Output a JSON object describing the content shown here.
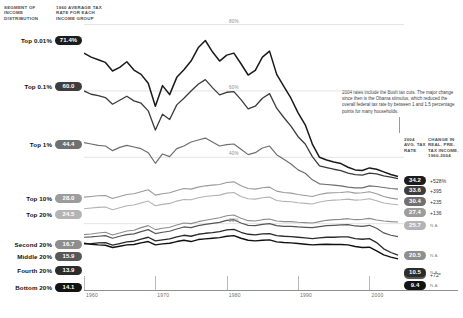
{
  "headers": {
    "segment": "SEGMENT OF INCOME DISTRIBUTION",
    "rate_1960": "1960 AVERAGE TAX RATE FOR EACH INCOME GROUP",
    "rate_2004": "2004 AVG. TAX RATE",
    "change": "CHANGE IN REAL, PRE-TAX INCOME, 1960-2004"
  },
  "annotation": "2004 rates include the Bush tax cuts. The major change since then is the Obama stimulus, which reduced the overall federal tax rate by between 1 and 1.5 percentage points for many households.",
  "chart_data": {
    "type": "line",
    "title": "",
    "xlabel": "",
    "ylabel": "",
    "xlim": [
      1960,
      2004
    ],
    "ylim": [
      0,
      85
    ],
    "grid": true,
    "legend_position": "inline-left-right",
    "xticks": [
      "1960",
      "1970",
      "1980",
      "1990",
      "2000"
    ],
    "yticks": [
      "20%",
      "40%",
      "60%",
      "80%"
    ],
    "ytick_values": [
      20,
      40,
      60,
      80
    ],
    "series": [
      {
        "name": "Top 0.01%",
        "value_1960": "71.4%",
        "value_2004": "34.2",
        "change": "+528%",
        "color": "#1a1a1a",
        "pill_color": "#1c1c1c",
        "width": 1.5,
        "values": [
          71.4,
          70.2,
          69.4,
          68.6,
          66.0,
          67.1,
          68.8,
          66.3,
          65.0,
          62.3,
          55.4,
          61.6,
          58.9,
          64.1,
          66.4,
          69.0,
          73.0,
          75.2,
          71.8,
          69.0,
          70.8,
          71.4,
          68.2,
          64.8,
          66.2,
          70.2,
          72.0,
          65.0,
          61.4,
          57.8,
          53.4,
          49.8,
          44.0,
          40.0,
          39.2,
          38.6,
          38.1,
          37.0,
          36.2,
          36.0,
          36.8,
          36.4,
          35.6,
          34.8,
          34.2
        ]
      },
      {
        "name": "Top 0.1%",
        "value_1960": "60.0",
        "value_2004": "33.6",
        "change": "+395",
        "color": "#3b3b3b",
        "pill_color": "#3d3d3d",
        "width": 1.3,
        "values": [
          60.0,
          59.0,
          58.6,
          58.0,
          56.0,
          57.2,
          58.4,
          57.0,
          56.3,
          54.0,
          48.2,
          53.0,
          51.4,
          55.8,
          57.8,
          60.0,
          62.0,
          63.4,
          61.0,
          58.8,
          59.6,
          59.8,
          57.4,
          54.6,
          55.4,
          57.8,
          59.2,
          54.8,
          52.0,
          49.4,
          46.2,
          44.0,
          40.2,
          37.4,
          36.9,
          36.4,
          36.0,
          35.2,
          34.8,
          34.6,
          35.2,
          35.0,
          34.4,
          34.0,
          33.6
        ]
      },
      {
        "name": "Top 1%",
        "value_1960": "44.4",
        "value_2004": "30.4",
        "change": "+235",
        "color": "#6e6e6e",
        "pill_color": "#707070",
        "width": 1.2,
        "values": [
          44.4,
          44.0,
          43.6,
          43.4,
          42.0,
          43.0,
          43.6,
          43.1,
          42.6,
          41.4,
          38.2,
          41.0,
          40.2,
          42.6,
          43.4,
          44.6,
          45.2,
          45.8,
          44.6,
          43.4,
          43.8,
          44.0,
          42.4,
          40.8,
          41.4,
          42.8,
          43.4,
          40.8,
          39.4,
          38.0,
          36.2,
          35.2,
          33.2,
          32.0,
          31.8,
          31.6,
          31.4,
          31.0,
          30.8,
          30.8,
          31.4,
          31.2,
          30.9,
          30.6,
          30.4
        ]
      },
      {
        "name": "Top 10%",
        "value_1960": "28.0",
        "value_2004": "27.4",
        "change": "+136",
        "color": "#9a9a9a",
        "pill_color": "#9c9c9c",
        "width": 1.1,
        "values": [
          28.0,
          28.2,
          28.4,
          28.5,
          27.6,
          28.2,
          28.8,
          29.0,
          29.6,
          30.2,
          28.6,
          29.0,
          29.3,
          30.0,
          30.6,
          30.4,
          31.0,
          31.4,
          31.6,
          31.8,
          32.4,
          32.6,
          31.4,
          30.6,
          30.4,
          30.8,
          31.0,
          29.8,
          29.4,
          29.2,
          28.8,
          28.5,
          28.2,
          28.8,
          29.2,
          29.3,
          29.4,
          29.6,
          29.2,
          29.3,
          29.6,
          29.0,
          28.2,
          27.7,
          27.4
        ]
      },
      {
        "name": "Top 20%",
        "value_1960": "24.5",
        "value_2004": "25.7",
        "change": "N.A.",
        "color": "#b2b2b2",
        "pill_color": "#b4b4b4",
        "width": 1.1,
        "values": [
          24.5,
          24.7,
          24.9,
          25.0,
          24.2,
          24.8,
          25.4,
          25.6,
          26.2,
          26.8,
          25.4,
          25.8,
          26.1,
          26.8,
          27.3,
          27.2,
          27.8,
          28.2,
          28.4,
          28.6,
          29.2,
          29.4,
          28.2,
          27.5,
          27.4,
          27.8,
          28.0,
          27.0,
          26.7,
          26.6,
          26.3,
          26.1,
          25.9,
          26.5,
          26.9,
          27.1,
          27.2,
          27.4,
          27.1,
          27.2,
          27.5,
          26.9,
          26.2,
          25.9,
          25.7
        ]
      },
      {
        "name": "Second 20%",
        "value_1960": "16.7",
        "value_2004": "20.5",
        "change": "N.A.",
        "color": "#8c8c8c",
        "pill_color": "#8e8e8e",
        "width": 1.1,
        "values": [
          16.7,
          16.9,
          17.2,
          17.4,
          16.6,
          17.2,
          17.8,
          18.0,
          18.8,
          19.4,
          18.2,
          18.6,
          18.9,
          19.6,
          20.2,
          20.0,
          20.6,
          21.0,
          21.4,
          21.8,
          22.4,
          22.6,
          21.6,
          20.9,
          20.8,
          21.2,
          21.4,
          20.8,
          20.6,
          20.6,
          20.4,
          20.3,
          20.2,
          20.6,
          21.0,
          21.2,
          21.3,
          21.5,
          21.2,
          21.3,
          21.6,
          21.1,
          20.8,
          20.6,
          20.5
        ]
      },
      {
        "name": "Middle 20%",
        "value_1960": "15.9",
        "value_2004": "16.1",
        "change": "+72*",
        "color": "#555555",
        "pill_color": "#575757",
        "width": 1.2,
        "values": [
          15.9,
          16.0,
          16.2,
          16.4,
          15.6,
          16.2,
          16.7,
          16.9,
          17.6,
          18.2,
          17.0,
          17.4,
          17.7,
          18.4,
          19.0,
          18.8,
          19.4,
          19.8,
          20.1,
          20.4,
          21.0,
          21.2,
          20.2,
          19.5,
          19.4,
          19.8,
          20.0,
          19.4,
          19.2,
          19.2,
          19.0,
          18.9,
          18.8,
          19.1,
          19.4,
          19.5,
          19.6,
          19.7,
          19.3,
          19.2,
          19.5,
          18.6,
          17.2,
          16.5,
          16.1
        ]
      },
      {
        "name": "Fourth 20%",
        "value_1960": "13.9",
        "value_2004": "10.5",
        "change": "N.A.",
        "color": "#2a2a2a",
        "pill_color": "#2c2c2c",
        "width": 1.3,
        "values": [
          13.9,
          14.0,
          14.2,
          14.3,
          13.5,
          14.0,
          14.5,
          14.7,
          15.3,
          15.9,
          14.8,
          15.1,
          15.4,
          16.0,
          16.5,
          16.2,
          16.8,
          17.1,
          17.3,
          17.6,
          18.1,
          18.3,
          17.4,
          16.8,
          16.6,
          16.9,
          17.0,
          16.4,
          16.2,
          16.1,
          15.9,
          15.7,
          15.5,
          15.7,
          15.9,
          15.9,
          16.0,
          16.0,
          15.5,
          15.3,
          15.5,
          14.3,
          12.4,
          11.3,
          10.5
        ]
      },
      {
        "name": "Bottom 20%",
        "value_1960": "14.1",
        "value_2004": "9.4",
        "change": "N.A.",
        "color": "#111111",
        "pill_color": "#131313",
        "width": 1.4,
        "values": [
          14.1,
          13.8,
          13.6,
          13.5,
          12.8,
          13.2,
          13.6,
          13.7,
          14.2,
          14.6,
          13.6,
          13.9,
          14.1,
          14.6,
          15.0,
          14.6,
          15.2,
          15.4,
          15.6,
          15.8,
          16.2,
          16.4,
          15.6,
          15.0,
          14.8,
          15.0,
          15.1,
          14.5,
          14.3,
          14.2,
          14.0,
          13.8,
          13.6,
          13.7,
          13.8,
          13.7,
          13.7,
          13.6,
          13.1,
          12.8,
          12.9,
          11.8,
          10.6,
          9.9,
          9.4
        ]
      }
    ]
  }
}
